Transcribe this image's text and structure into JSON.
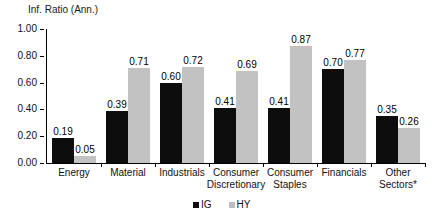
{
  "chart_data": {
    "type": "bar",
    "title": "Inf. Ratio (Ann.)",
    "xlabel": "",
    "ylabel": "",
    "ylim": [
      0.0,
      1.0
    ],
    "ytick_labels": [
      "1.00",
      "0.80",
      "0.60",
      "0.40",
      "0.20",
      "0.00"
    ],
    "ytick_values": [
      1.0,
      0.8,
      0.6,
      0.4,
      0.2,
      0.0
    ],
    "grid": false,
    "legend_position": "bottom-center",
    "categories": [
      "Energy",
      "Material",
      "Industrials",
      "Consumer Discretionary",
      "Consumer Staples",
      "Financials",
      "Other Sectors*"
    ],
    "category_lines": [
      [
        "Energy"
      ],
      [
        "Material"
      ],
      [
        "Industrials"
      ],
      [
        "Consumer",
        "Discretionary"
      ],
      [
        "Consumer",
        "Staples"
      ],
      [
        "Financials"
      ],
      [
        "Other",
        "Sectors*"
      ]
    ],
    "series": [
      {
        "name": "IG",
        "color": "#0d0d0d",
        "values": [
          0.19,
          0.39,
          0.6,
          0.41,
          0.41,
          0.7,
          0.35
        ],
        "labels": [
          "0.19",
          "0.39",
          "0.60",
          "0.41",
          "0.41",
          "0.70",
          "0.35"
        ]
      },
      {
        "name": "HY",
        "color": "#c2c2c2",
        "values": [
          0.05,
          0.71,
          0.72,
          0.69,
          0.87,
          0.77,
          0.26
        ],
        "labels": [
          "0.05",
          "0.71",
          "0.72",
          "0.69",
          "0.87",
          "0.77",
          "0.26"
        ]
      }
    ]
  },
  "legend": {
    "items": [
      {
        "label": "IG",
        "color": "#0d0d0d"
      },
      {
        "label": "HY",
        "color": "#bdbdbd"
      }
    ]
  }
}
